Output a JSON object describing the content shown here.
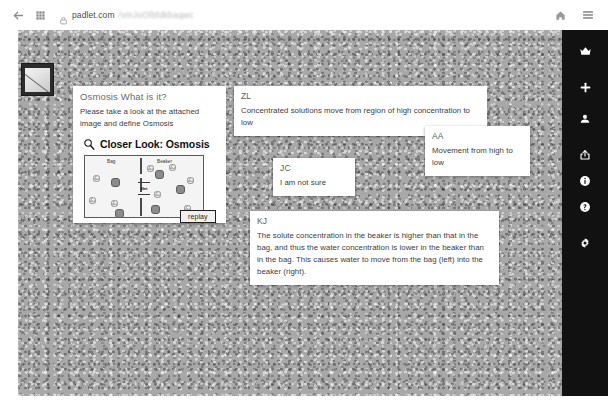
{
  "browser": {
    "back_icon": "back-arrow-icon",
    "apps_icon": "apps-grid-icon",
    "lock_icon": "site-info-icon",
    "url_domain": "padlet.com",
    "url_path": "/vmJoOlbfdkbaqwc",
    "home_icon": "home-icon",
    "menu_icon": "hamburger-menu-icon"
  },
  "board": {
    "thumbnail_name": "board-thumbnail"
  },
  "rail": {
    "items": [
      {
        "name": "crown-icon",
        "label": "Upgrade"
      },
      {
        "name": "plus-icon",
        "label": "Add post"
      },
      {
        "name": "person-icon",
        "label": "Members"
      },
      {
        "name": "share-icon",
        "label": "Share"
      },
      {
        "name": "info-icon",
        "label": "Info"
      },
      {
        "name": "help-icon",
        "label": "Help"
      },
      {
        "name": "gear-icon",
        "label": "Settings"
      }
    ]
  },
  "posts": {
    "main": {
      "title": "Osmosis What is it?",
      "body": "Please take a look at the attached image and define Osmosis",
      "attachment": {
        "title": "Closer Look: Osmosis",
        "magnifier_icon": "magnifier-icon",
        "label_left": "Bag",
        "label_right": "Beaker",
        "net_label": "Net",
        "replay_label": "replay"
      }
    },
    "list": [
      {
        "author": "ZL",
        "body": "Concentrated solutions move from region of high concentration to low"
      },
      {
        "author": "AA",
        "body": "Movement from high to low"
      },
      {
        "author": "JC",
        "body": "I am not sure"
      },
      {
        "author": "KJ",
        "body": "The solute concentration in the beaker is higher than that in the bag, and thus the water concentration is lower in the beaker than in the bag. This causes water to move from the bag (left) into the beaker (right)."
      }
    ]
  }
}
